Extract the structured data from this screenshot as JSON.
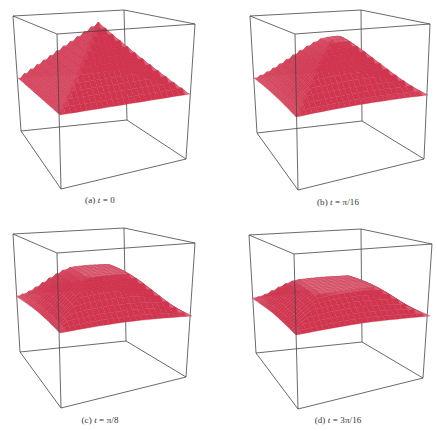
{
  "figure": {
    "panels": [
      {
        "id": "a",
        "label": "(a)",
        "variable": "t",
        "equals": " = ",
        "value": "0"
      },
      {
        "id": "b",
        "label": "(b)",
        "variable": "t",
        "equals": " = ",
        "value": "π/16"
      },
      {
        "id": "c",
        "label": "(c)",
        "variable": "t",
        "equals": " = ",
        "value": "π/8"
      },
      {
        "id": "d",
        "label": "(d)",
        "variable": "t",
        "equals": " = ",
        "value": "3π/16"
      }
    ]
  },
  "colors": {
    "box_edge": "#444444",
    "surface_dark": "#d3354f",
    "surface_light": "#f4aab8",
    "grid_line": "#c0324c",
    "caption_text": "#333333"
  },
  "chart_data": {
    "type": "surface3d",
    "title": "",
    "grid_resolution": 24,
    "panels": [
      {
        "caption": "(a) t = 0",
        "t": "0",
        "peak_height": 1.0,
        "plateau_radius": 0.0,
        "edge_smoothing": 0.0,
        "box": {
          "top": [
            [
              13,
              16
            ],
            [
              124,
              10
            ],
            [
              195,
              24
            ],
            [
              57,
              34
            ]
          ],
          "bottom": [
            [
              21,
              131
            ],
            [
              127,
              120
            ],
            [
              186,
              159
            ],
            [
              61,
              189
            ]
          ]
        },
        "surface": {
          "apex": [
            97,
            22
          ],
          "left": [
            18,
            78
          ],
          "back": [
            125,
            70
          ],
          "right": [
            190,
            94
          ],
          "front": [
            60,
            115
          ]
        },
        "caption_pos": [
          100,
          201
        ]
      },
      {
        "caption": "(b) t = π/16",
        "t": "π/16",
        "peak_height": 0.82,
        "plateau_radius": 0.12,
        "edge_smoothing": 0.25,
        "box": {
          "top": [
            [
              250,
              16
            ],
            [
              361,
              10
            ],
            [
              430,
              24
            ],
            [
              295,
              34
            ]
          ],
          "bottom": [
            [
              257,
              133
            ],
            [
              362,
              121
            ],
            [
              424,
              159
            ],
            [
              298,
              190
            ]
          ]
        },
        "surface": {
          "apex": [
            333,
            38
          ],
          "left": [
            254,
            78
          ],
          "back": [
            362,
            71
          ],
          "right": [
            428,
            95
          ],
          "front": [
            296,
            117
          ]
        },
        "caption_pos": [
          338,
          203
        ]
      },
      {
        "caption": "(c) t = π/8",
        "t": "π/8",
        "peak_height": 0.55,
        "plateau_radius": 0.3,
        "edge_smoothing": 0.45,
        "box": {
          "top": [
            [
              13,
              234
            ],
            [
              124,
              228
            ],
            [
              195,
              243
            ],
            [
              57,
              253
            ]
          ],
          "bottom": [
            [
              20,
              352
            ],
            [
              126,
              341
            ],
            [
              186,
              377
            ],
            [
              61,
              408
            ]
          ]
        },
        "surface": {
          "apex": [
            100,
            270
          ],
          "left": [
            16,
            296
          ],
          "back": [
            126,
            291
          ],
          "right": [
            192,
            316
          ],
          "front": [
            60,
            333
          ]
        },
        "caption_pos": [
          100,
          421
        ]
      },
      {
        "caption": "(d) t = 3π/16",
        "t": "3π/16",
        "peak_height": 0.35,
        "plateau_radius": 0.42,
        "edge_smoothing": 0.55,
        "box": {
          "top": [
            [
              249,
              235
            ],
            [
              361,
              229
            ],
            [
              432,
              244
            ],
            [
              294,
              254
            ]
          ],
          "bottom": [
            [
              256,
              353
            ],
            [
              362,
              342
            ],
            [
              423,
              378
            ],
            [
              298,
              409
            ]
          ]
        },
        "surface": {
          "apex": [
            335,
            284
          ],
          "left": [
            252,
            298
          ],
          "back": [
            362,
            292
          ],
          "right": [
            430,
            316
          ],
          "front": [
            296,
            335
          ]
        },
        "caption_pos": [
          338,
          421
        ]
      }
    ],
    "axes": {
      "visible_ticks": false,
      "grid": false,
      "bounding_box": true
    }
  }
}
